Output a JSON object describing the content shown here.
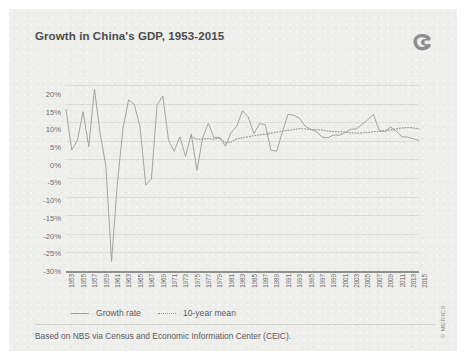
{
  "header": {
    "title": "Growth in China's GDP, 1953-2015",
    "logo": "merics-logo-icon"
  },
  "footer": {
    "source": "Based on NBS via Census and Economic Information Center (CEIC).",
    "copyright": "© MERICS"
  },
  "legend": {
    "items": [
      {
        "label": "Growth rate",
        "style": "solid",
        "color": "#9a9a9a"
      },
      {
        "label": "10-year mean",
        "style": "dotted",
        "color": "#9a9a9a"
      }
    ]
  },
  "chart_data": {
    "type": "line",
    "title": "Growth in China's GDP, 1953-2015",
    "xlabel": "",
    "ylabel": "",
    "ylim": [
      -30,
      22.5
    ],
    "xlim": [
      1953,
      2015
    ],
    "grid": true,
    "legend_position": "bottom-left",
    "yticks": [
      "20%",
      "15%",
      "10%",
      "5%",
      "0%",
      "-5%",
      "-10%",
      "-15%",
      "-20%",
      "-25%",
      "-30%"
    ],
    "ytick_values": [
      20,
      15,
      10,
      5,
      0,
      -5,
      -10,
      -15,
      -20,
      -25,
      -30
    ],
    "xticks": [
      "1953",
      "1955",
      "1957",
      "1959",
      "1961",
      "1963",
      "1965",
      "1967",
      "1969",
      "1971",
      "1973",
      "1975",
      "1977",
      "1979",
      "1981",
      "1983",
      "1985",
      "1987",
      "1989",
      "1991",
      "1993",
      "1995",
      "1997",
      "1999",
      "2001",
      "2003",
      "2005",
      "2007",
      "2009",
      "2011",
      "2013",
      "2015"
    ],
    "x": [
      1953,
      1954,
      1955,
      1956,
      1957,
      1958,
      1959,
      1960,
      1961,
      1962,
      1963,
      1964,
      1965,
      1966,
      1967,
      1968,
      1969,
      1970,
      1971,
      1972,
      1973,
      1974,
      1975,
      1976,
      1977,
      1978,
      1979,
      1980,
      1981,
      1982,
      1983,
      1984,
      1985,
      1986,
      1987,
      1988,
      1989,
      1990,
      1991,
      1992,
      1993,
      1994,
      1995,
      1996,
      1997,
      1998,
      1999,
      2000,
      2001,
      2002,
      2003,
      2004,
      2005,
      2006,
      2007,
      2008,
      2009,
      2010,
      2011,
      2012,
      2013,
      2014,
      2015
    ],
    "series": [
      {
        "name": "Growth rate",
        "style": "solid",
        "color": "#9a9a9a",
        "values": [
          15.6,
          4.2,
          6.8,
          15.0,
          5.1,
          21.3,
          8.8,
          -0.3,
          -27.3,
          -5.6,
          10.2,
          18.3,
          17.0,
          10.7,
          -5.7,
          -4.1,
          16.9,
          19.4,
          7.0,
          3.8,
          7.9,
          2.3,
          8.7,
          -1.6,
          7.6,
          11.7,
          7.6,
          7.8,
          5.2,
          9.1,
          10.9,
          15.2,
          13.5,
          8.8,
          11.6,
          11.3,
          4.1,
          3.8,
          9.2,
          14.2,
          14.0,
          13.1,
          10.9,
          10.0,
          9.3,
          7.8,
          7.6,
          8.4,
          8.3,
          9.1,
          10.0,
          10.1,
          11.4,
          12.7,
          14.2,
          9.7,
          9.4,
          10.6,
          9.5,
          7.9,
          7.8,
          7.3,
          6.9
        ]
      },
      {
        "name": "10-year mean",
        "style": "dotted",
        "color": "#9a9a9a",
        "values": [
          null,
          null,
          null,
          null,
          null,
          null,
          null,
          null,
          null,
          null,
          null,
          null,
          null,
          null,
          null,
          null,
          null,
          null,
          null,
          null,
          null,
          null,
          7.9,
          7.2,
          7.2,
          7.4,
          7.2,
          7.5,
          6.2,
          6.4,
          7.3,
          7.6,
          7.9,
          8.2,
          8.4,
          8.6,
          8.9,
          9.2,
          9.5,
          9.7,
          9.9,
          10.2,
          10.1,
          9.9,
          9.9,
          9.8,
          9.5,
          9.4,
          9.3,
          9.2,
          9.0,
          8.9,
          9.0,
          9.1,
          9.3,
          9.4,
          9.5,
          9.8,
          10.1,
          10.4,
          10.5,
          10.4,
          10.1
        ]
      }
    ]
  }
}
